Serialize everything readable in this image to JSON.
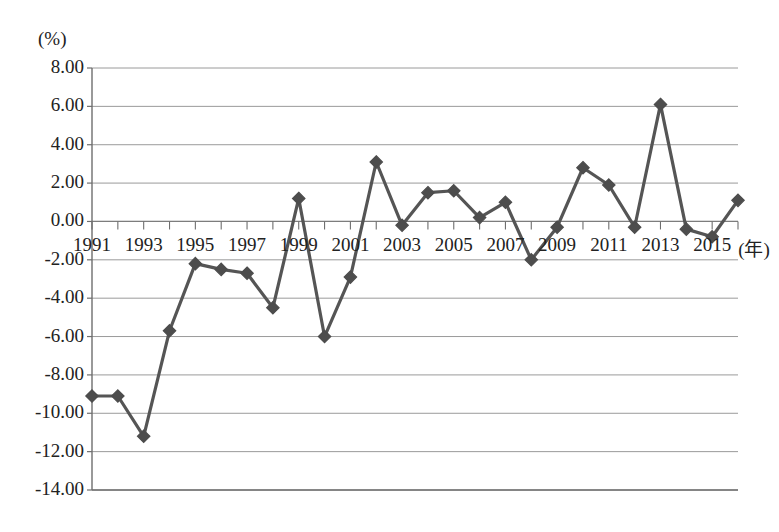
{
  "chart_data": {
    "type": "line",
    "title": "",
    "xlabel": "(年)",
    "ylabel": "(%)",
    "unit_top_left": "(%)",
    "x_axis_unit_suffix": "(年)",
    "grid": true,
    "legend": "none",
    "marker": "diamond",
    "line_color": "#555555",
    "marker_color": "#4d4d4d",
    "grid_color": "#9a9a9a",
    "axis_color": "#6e6e6e",
    "ylim": [
      -14.0,
      8.0
    ],
    "ytick_step": 2.0,
    "ytick_labels": [
      "8.00",
      "6.00",
      "4.00",
      "2.00",
      "0.00",
      "-2.00",
      "-4.00",
      "-6.00",
      "-8.00",
      "-10.00",
      "-12.00",
      "-14.00"
    ],
    "ytick_values": [
      8,
      6,
      4,
      2,
      0,
      -2,
      -4,
      -6,
      -8,
      -10,
      -12,
      -14
    ],
    "xtick_labels": [
      "1991",
      "1993",
      "1995",
      "1997",
      "1999",
      "2001",
      "2003",
      "2005",
      "2007",
      "2009",
      "2011",
      "2013",
      "2015"
    ],
    "xtick_values": [
      1991,
      1993,
      1995,
      1997,
      1999,
      2001,
      2003,
      2005,
      2007,
      2009,
      2011,
      2013,
      2015
    ],
    "xlim": [
      1991,
      2016
    ],
    "x": [
      1991,
      1992,
      1993,
      1994,
      1995,
      1996,
      1997,
      1998,
      1999,
      2000,
      2001,
      2002,
      2003,
      2004,
      2005,
      2006,
      2007,
      2008,
      2009,
      2010,
      2011,
      2012,
      2013,
      2014,
      2015,
      2016
    ],
    "categories": [
      "1991",
      "1992",
      "1993",
      "1994",
      "1995",
      "1996",
      "1997",
      "1998",
      "1999",
      "2000",
      "2001",
      "2002",
      "2003",
      "2004",
      "2005",
      "2006",
      "2007",
      "2008",
      "2009",
      "2010",
      "2011",
      "2012",
      "2013",
      "2014",
      "2015",
      "2016"
    ],
    "values": [
      -9.1,
      -9.1,
      -11.2,
      -5.7,
      -2.2,
      -2.5,
      -2.7,
      -4.5,
      1.2,
      -6.0,
      -2.9,
      3.1,
      -0.2,
      1.5,
      1.6,
      0.2,
      1.0,
      -2.0,
      -0.3,
      2.8,
      1.9,
      -0.3,
      6.1,
      -0.4,
      -0.8,
      1.1
    ],
    "series": [
      {
        "name": "series-1",
        "values": [
          -9.1,
          -9.1,
          -11.2,
          -5.7,
          -2.2,
          -2.5,
          -2.7,
          -4.5,
          1.2,
          -6.0,
          -2.9,
          3.1,
          -0.2,
          1.5,
          1.6,
          0.2,
          1.0,
          -2.0,
          -0.3,
          2.8,
          1.9,
          -0.3,
          6.1,
          -0.4,
          -0.8,
          1.1
        ]
      }
    ]
  }
}
